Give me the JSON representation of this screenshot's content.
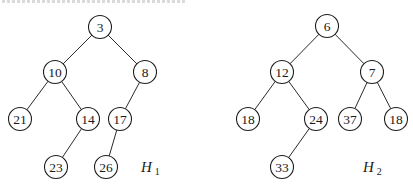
{
  "diagram": {
    "type": "binary-heap-trees",
    "node_radius": 11.5,
    "colors": {
      "stroke": "#1e1e1e",
      "fill": "#ffffff",
      "text": "#1a1a1a"
    },
    "heaps": [
      {
        "name": "H",
        "subscript": "1",
        "label_pos": [
          141,
          172
        ],
        "nodes": [
          {
            "id": "a1",
            "value": "3",
            "x": 100,
            "y": 27
          },
          {
            "id": "a2",
            "value": "10",
            "x": 55,
            "y": 72
          },
          {
            "id": "a3",
            "value": "8",
            "x": 145,
            "y": 72
          },
          {
            "id": "a4",
            "value": "21",
            "x": 20,
            "y": 119
          },
          {
            "id": "a5",
            "value": "14",
            "x": 88,
            "y": 119
          },
          {
            "id": "a6",
            "value": "17",
            "x": 120,
            "y": 119
          },
          {
            "id": "a7",
            "value": "23",
            "x": 56,
            "y": 167
          },
          {
            "id": "a8",
            "value": "26",
            "x": 106,
            "y": 167
          }
        ],
        "edges": [
          [
            "a1",
            "a2"
          ],
          [
            "a1",
            "a3"
          ],
          [
            "a2",
            "a4"
          ],
          [
            "a2",
            "a5"
          ],
          [
            "a3",
            "a6"
          ],
          [
            "a5",
            "a7"
          ],
          [
            "a6",
            "a8"
          ]
        ]
      },
      {
        "name": "H",
        "subscript": "2",
        "label_pos": [
          363,
          172
        ],
        "nodes": [
          {
            "id": "b1",
            "value": "6",
            "x": 327,
            "y": 26
          },
          {
            "id": "b2",
            "value": "12",
            "x": 282,
            "y": 72
          },
          {
            "id": "b3",
            "value": "7",
            "x": 372,
            "y": 72
          },
          {
            "id": "b4",
            "value": "18",
            "x": 248,
            "y": 119
          },
          {
            "id": "b5",
            "value": "24",
            "x": 316,
            "y": 119
          },
          {
            "id": "b6",
            "value": "37",
            "x": 350,
            "y": 119
          },
          {
            "id": "b7",
            "value": "18",
            "x": 396,
            "y": 119
          },
          {
            "id": "b8",
            "value": "33",
            "x": 282,
            "y": 167
          }
        ],
        "edges": [
          [
            "b1",
            "b2"
          ],
          [
            "b1",
            "b3"
          ],
          [
            "b2",
            "b4"
          ],
          [
            "b2",
            "b5"
          ],
          [
            "b3",
            "b6"
          ],
          [
            "b3",
            "b7"
          ],
          [
            "b5",
            "b8"
          ]
        ]
      }
    ]
  }
}
